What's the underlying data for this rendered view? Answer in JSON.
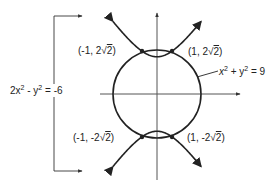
{
  "figure": {
    "type": "graph-of-system",
    "colors": {
      "ink": "#222222",
      "axis": "#555555",
      "background": "#ffffff"
    },
    "axes": {
      "x_arrow": true,
      "y_arrow": true
    },
    "curves": [
      {
        "name": "circle",
        "equation": "x² + y² = 9",
        "label_parts": [
          "x",
          "2",
          " + y",
          "2",
          " = 9"
        ]
      },
      {
        "name": "hyperbola",
        "equation": "2x² - y² = -6",
        "label_parts": [
          "2x",
          "2",
          " - y",
          "2",
          " = -6"
        ]
      }
    ],
    "intersection_points": [
      {
        "label": "(-1, 2√2)",
        "x": -1,
        "y": 2.828
      },
      {
        "label": "(1, 2√2)",
        "x": 1,
        "y": 2.828
      },
      {
        "label": "(-1, -2√2)",
        "x": -1,
        "y": -2.828
      },
      {
        "label": "(1, -2√2)",
        "x": 1,
        "y": -2.828
      }
    ]
  },
  "labels": {
    "circle_eq": {
      "a": "x",
      "a_exp": "2",
      "b": " + y",
      "b_exp": "2",
      "c": " = 9"
    },
    "hyperbola_eq": {
      "a": "2x",
      "a_exp": "2",
      "b": " - y",
      "b_exp": "2",
      "c": " = -6"
    },
    "p1": {
      "pre": "(-1, 2",
      "rad": "2",
      "post": ")"
    },
    "p2": {
      "pre": "(1, 2",
      "rad": "2",
      "post": ")"
    },
    "p3": {
      "pre": "(-1, -2",
      "rad": "2",
      "post": ")"
    },
    "p4": {
      "pre": "(1, -2",
      "rad": "2",
      "post": ")"
    }
  }
}
